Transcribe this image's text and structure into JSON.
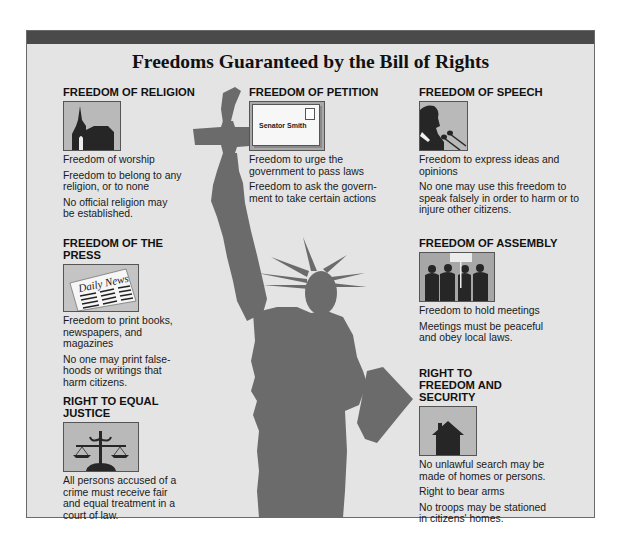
{
  "title": "Freedoms Guaranteed by the Bill of Rights",
  "colors": {
    "panel_bg": "#e4e4e4",
    "top_bar": "#4a4a4a",
    "silhouette": "#6b6b6b",
    "image_bg": "#b9b9b9"
  },
  "sections": {
    "religion": {
      "heading": "FREEDOM OF RELIGION",
      "icon": "church-icon",
      "lines": [
        "Freedom of worship",
        "Freedom to belong to any religion, or to none",
        "No official religion may be established."
      ]
    },
    "petition": {
      "heading": "FREEDOM OF PETITION",
      "icon": "envelope-icon",
      "envelope_text": "Senator Smith",
      "lines": [
        "Freedom to urge the government to pass laws",
        "Freedom to ask the govern-ment to take certain actions"
      ]
    },
    "speech": {
      "heading": "FREEDOM OF SPEECH",
      "icon": "speaker-microphone-icon",
      "lines": [
        "Freedom to express ideas and opinions",
        "No one may use this freedom to speak falsely in order to harm or to injure other citizens."
      ]
    },
    "press": {
      "heading": "FREEDOM OF THE PRESS",
      "icon": "newspaper-icon",
      "newspaper_text": "Daily News",
      "lines": [
        "Freedom to print books, newspapers, and magazines",
        "No one may print false-hoods or writings that harm citizens."
      ]
    },
    "assembly": {
      "heading": "FREEDOM OF ASSEMBLY",
      "icon": "crowd-icon",
      "lines": [
        "Freedom to hold meetings",
        "Meetings must be peaceful and obey local laws."
      ]
    },
    "justice": {
      "heading": "RIGHT TO EQUAL JUSTICE",
      "icon": "scales-icon",
      "lines": [
        "All persons accused of a crime must receive fair and equal treatment in a court of law."
      ]
    },
    "security": {
      "heading": "RIGHT TO FREEDOM AND SECURITY",
      "icon": "house-icon",
      "lines": [
        "No unlawful search may be made of homes or persons.",
        "Right to bear arms",
        "No troops may be stationed in citizens' homes."
      ]
    }
  }
}
